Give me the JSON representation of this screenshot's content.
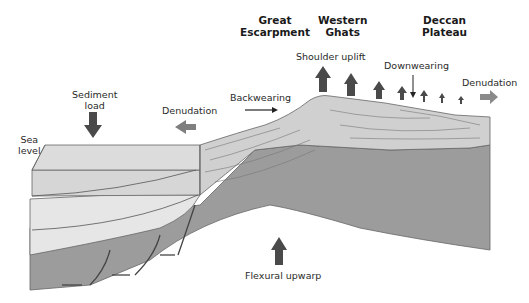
{
  "diagram": {
    "type": "block-diagram",
    "headings": {
      "great_escarpment": "Great\nEscarpment",
      "western_ghats": "Western\nGhats",
      "deccan_plateau": "Deccan\nPlateau"
    },
    "labels": {
      "sediment_load": "Sediment\nload",
      "denudation_left": "Denudation",
      "backwearing": "Backwearing",
      "shoulder_uplift": "Shoulder uplift",
      "downwearing": "Downwearing",
      "denudation_right": "Denudation",
      "sea_level": "Sea\nlevel",
      "flexural_upwarp": "Flexural upwarp"
    },
    "colors": {
      "arrow_dark": "#4a4a4a",
      "arrow_mid": "#808080",
      "land_surface": "#cfcfcf",
      "crust_side": "#9a9a9a",
      "sediment_light": "#e3e3e3",
      "sediment_mid": "#d2d2d2",
      "outline": "#555555"
    },
    "uplift_arrow_count": 8
  }
}
